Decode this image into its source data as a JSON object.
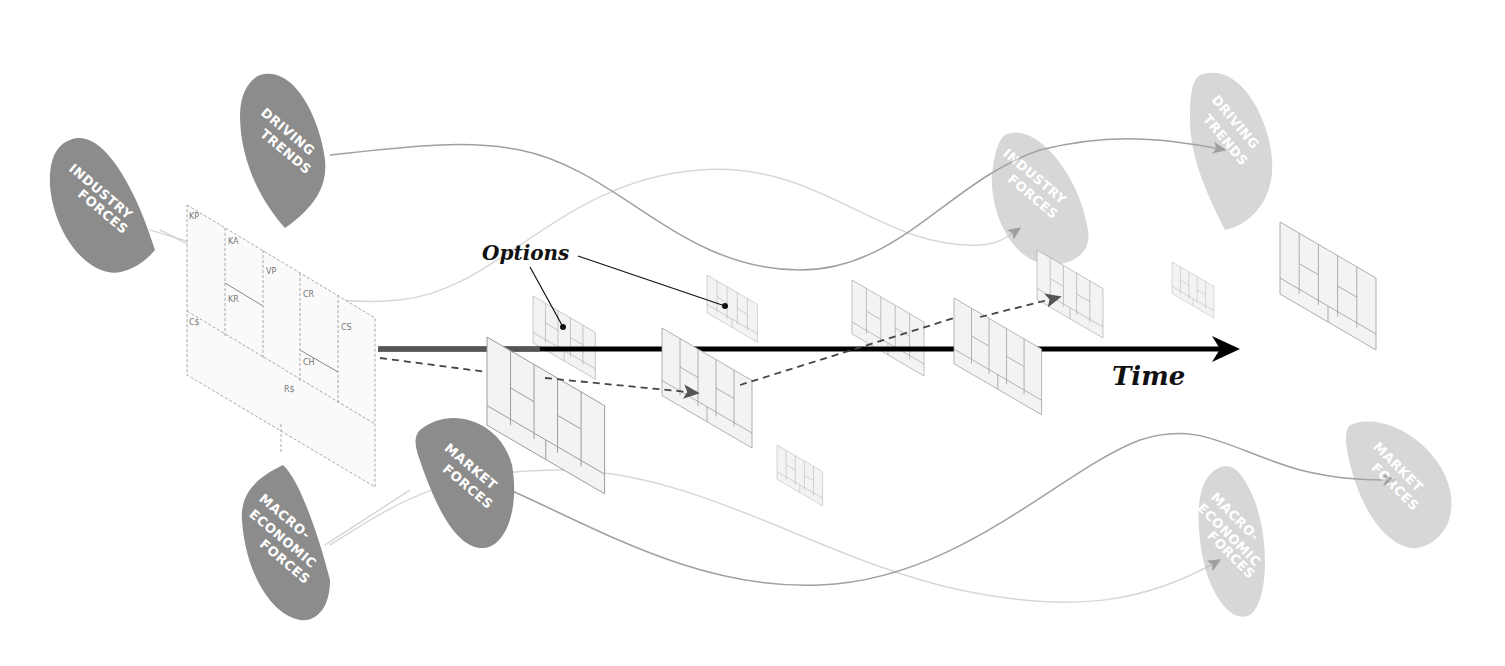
{
  "diagram": {
    "time_label": "Time",
    "options_label": "Options",
    "forces_present": [
      {
        "id": "industry",
        "lines": [
          "INDUSTRY",
          "FORCES"
        ]
      },
      {
        "id": "driving",
        "lines": [
          "DRIVING",
          "TRENDS"
        ]
      },
      {
        "id": "macro",
        "lines": [
          "MACRO-",
          "ECONOMIC",
          "FORCES"
        ]
      },
      {
        "id": "market",
        "lines": [
          "MARKET",
          "FORCES"
        ]
      }
    ],
    "forces_future": [
      {
        "id": "industry",
        "lines": [
          "INDUSTRY",
          "FORCES"
        ]
      },
      {
        "id": "driving",
        "lines": [
          "DRIVING",
          "TRENDS"
        ]
      },
      {
        "id": "macro",
        "lines": [
          "MACRO-",
          "ECONOMIC",
          "FORCES"
        ]
      },
      {
        "id": "market",
        "lines": [
          "MARKET",
          "FORCES"
        ]
      }
    ],
    "canvas_blocks": {
      "kp": "KP",
      "ka": "KA",
      "vp": "VP",
      "cr": "CR",
      "cs": "CS",
      "kr": "KR",
      "ch": "CH",
      "cost": "C$",
      "rev": "R$"
    }
  },
  "colors": {
    "blob_dark": "#8c8c8c",
    "blob_light": "#dcdcdc",
    "timeline": "#000000",
    "curve_dark": "#9a9a9a",
    "curve_light": "#d6d6d6",
    "grid_line": "#9a9a9a",
    "grid_fill": "#f3f3f3"
  }
}
